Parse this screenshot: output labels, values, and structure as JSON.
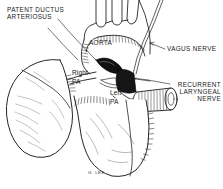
{
  "figure": {
    "style": "pen-and-ink anatomical line drawing",
    "background_color": "#ffffff",
    "ink_color": "#1a1a1a"
  },
  "labels": {
    "pda_line1": "PATENT DUCTUS",
    "pda_line2": "ARTERIOSUS",
    "aorta": "AORTA",
    "vagus": "VAGUS NERVE",
    "rln_line1": "RECURRENT",
    "rln_line2": "LARYNGEAL",
    "rln_line3": "NERVE",
    "right_pa_line1": "Right",
    "right_pa_line2": "PA",
    "left_pa_line1": "Left",
    "left_pa_line2": "PA"
  },
  "signature": {
    "text": "G. LEE."
  },
  "structures": [
    {
      "name": "aortic-arch",
      "label": "AORTA"
    },
    {
      "name": "brachiocephalic-branches",
      "count": 3
    },
    {
      "name": "patent-ductus-arteriosus",
      "label": "PATENT DUCTUS ARTERIOSUS"
    },
    {
      "name": "right-pulmonary-artery",
      "label": "Right PA"
    },
    {
      "name": "left-pulmonary-artery",
      "label": "Left PA"
    },
    {
      "name": "vagus-nerve",
      "label": "VAGUS NERVE"
    },
    {
      "name": "recurrent-laryngeal-nerve",
      "label": "RECURRENT LARYNGEAL NERVE"
    },
    {
      "name": "left-lung"
    },
    {
      "name": "heart-body"
    },
    {
      "name": "esophagus-tube"
    }
  ]
}
